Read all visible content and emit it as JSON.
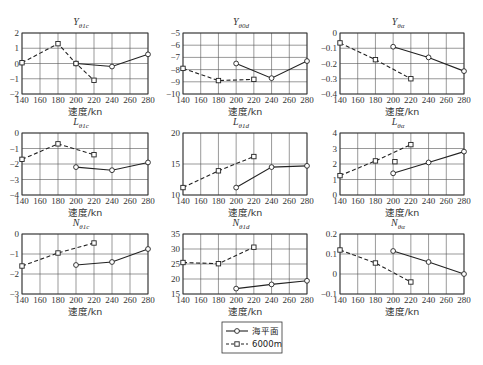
{
  "figure": {
    "layout": {
      "rows": 3,
      "cols": 3
    },
    "x_label": "速度/kn",
    "x_ticks": [
      140,
      160,
      180,
      200,
      220,
      240,
      260,
      280
    ],
    "legend": [
      {
        "label": "海平面",
        "style": "solid",
        "marker": "circle"
      },
      {
        "label": "6000m",
        "style": "dashed",
        "marker": "square"
      }
    ]
  },
  "chart_data": [
    {
      "type": "line",
      "title": "Y_θ1c",
      "title_main": "Y",
      "title_sub": "θ1c",
      "xlabel": "速度/kn",
      "ylabel": "",
      "xlim": [
        140,
        280
      ],
      "ylim": [
        -2,
        2
      ],
      "y_ticks": [
        -2,
        -1,
        0,
        1,
        2
      ],
      "grid": true,
      "series": [
        {
          "name": "海平面",
          "x": [
            200,
            240,
            280
          ],
          "values": [
            0.0,
            -0.2,
            0.6
          ]
        },
        {
          "name": "6000m",
          "x": [
            140,
            180,
            200,
            220
          ],
          "values": [
            0.05,
            1.3,
            0.0,
            -1.1
          ]
        }
      ]
    },
    {
      "type": "line",
      "title": "Y_θ0d",
      "title_main": "Y",
      "title_sub": "θ0d",
      "xlabel": "速度/kn",
      "ylabel": "",
      "xlim": [
        140,
        280
      ],
      "ylim": [
        -10,
        -5
      ],
      "y_ticks": [
        -10,
        -9,
        -8,
        -7,
        -6,
        -5
      ],
      "grid": true,
      "series": [
        {
          "name": "海平面",
          "x": [
            200,
            240,
            280
          ],
          "values": [
            -7.5,
            -8.7,
            -7.3
          ]
        },
        {
          "name": "6000m",
          "x": [
            140,
            180,
            220
          ],
          "values": [
            -7.9,
            -8.9,
            -8.8
          ]
        }
      ]
    },
    {
      "type": "line",
      "title": "Y_θα",
      "title_main": "Y",
      "title_sub": "θα",
      "xlabel": "速度/kn",
      "ylabel": "",
      "xlim": [
        140,
        280
      ],
      "ylim": [
        -0.4,
        0
      ],
      "y_ticks": [
        -0.4,
        -0.3,
        -0.2,
        -0.1,
        0
      ],
      "grid": true,
      "series": [
        {
          "name": "海平面",
          "x": [
            200,
            240,
            280
          ],
          "values": [
            -0.09,
            -0.16,
            -0.25
          ]
        },
        {
          "name": "6000m",
          "x": [
            140,
            180,
            220
          ],
          "values": [
            -0.065,
            -0.175,
            -0.3
          ]
        }
      ]
    },
    {
      "type": "line",
      "title": "L_θ1c",
      "title_main": "L",
      "title_sub": "θ1c",
      "xlabel": "速度/kn",
      "ylabel": "",
      "xlim": [
        140,
        280
      ],
      "ylim": [
        -4,
        0
      ],
      "y_ticks": [
        -4,
        -3,
        -2,
        -1,
        0
      ],
      "grid": true,
      "series": [
        {
          "name": "海平面",
          "x": [
            200,
            240,
            280
          ],
          "values": [
            -2.2,
            -2.4,
            -1.9
          ]
        },
        {
          "name": "6000m",
          "x": [
            140,
            180,
            220
          ],
          "values": [
            -1.7,
            -0.7,
            -1.4
          ]
        }
      ]
    },
    {
      "type": "line",
      "title": "L_θ1d",
      "title_main": "L",
      "title_sub": "θ1d",
      "xlabel": "速度/kn",
      "ylabel": "",
      "xlim": [
        140,
        280
      ],
      "ylim": [
        10,
        20
      ],
      "y_ticks": [
        10,
        15,
        20
      ],
      "grid": true,
      "series": [
        {
          "name": "海平面",
          "x": [
            200,
            240,
            280
          ],
          "values": [
            11.2,
            14.5,
            14.7
          ]
        },
        {
          "name": "6000m",
          "x": [
            140,
            180,
            220
          ],
          "values": [
            11.2,
            13.9,
            16.2
          ]
        }
      ]
    },
    {
      "type": "line",
      "title": "L_θα",
      "title_main": "L",
      "title_sub": "θα",
      "xlabel": "速度/kn",
      "ylabel": "",
      "xlim": [
        140,
        280
      ],
      "ylim": [
        0,
        4
      ],
      "y_ticks": [
        0,
        1,
        2,
        3,
        4
      ],
      "grid": true,
      "series": [
        {
          "name": "海平面",
          "x": [
            200,
            240,
            280
          ],
          "values": [
            1.4,
            2.1,
            2.8
          ]
        },
        {
          "name": "6000m",
          "x": [
            140,
            180,
            220
          ],
          "values": [
            1.25,
            2.2,
            3.25
          ]
        },
        {
          "name": "6000m (isolated)",
          "x": [
            202
          ],
          "values": [
            2.15
          ]
        }
      ]
    },
    {
      "type": "line",
      "title": "N_θ1c",
      "title_main": "N",
      "title_sub": "θ1c",
      "xlabel": "速度/kn",
      "ylabel": "",
      "xlim": [
        140,
        280
      ],
      "ylim": [
        -3,
        0
      ],
      "y_ticks": [
        -3,
        -2,
        -1,
        0
      ],
      "grid": true,
      "series": [
        {
          "name": "海平面",
          "x": [
            200,
            240,
            280
          ],
          "values": [
            -1.55,
            -1.4,
            -0.75
          ]
        },
        {
          "name": "6000m",
          "x": [
            140,
            180,
            220
          ],
          "values": [
            -1.6,
            -0.95,
            -0.45
          ]
        }
      ]
    },
    {
      "type": "line",
      "title": "N_θ1d",
      "title_main": "N",
      "title_sub": "θ1d",
      "xlabel": "速度/kn",
      "ylabel": "",
      "xlim": [
        140,
        280
      ],
      "ylim": [
        15,
        35
      ],
      "y_ticks": [
        15,
        20,
        25,
        30,
        35
      ],
      "grid": true,
      "series": [
        {
          "name": "海平面",
          "x": [
            200,
            240,
            280
          ],
          "values": [
            16.8,
            18.2,
            19.4
          ]
        },
        {
          "name": "6000m",
          "x": [
            140,
            180,
            220
          ],
          "values": [
            25.5,
            25.1,
            30.6
          ]
        }
      ]
    },
    {
      "type": "line",
      "title": "N_θα",
      "title_main": "N",
      "title_sub": "θα",
      "xlabel": "速度/kn",
      "ylabel": "",
      "xlim": [
        140,
        280
      ],
      "ylim": [
        -0.1,
        0.2
      ],
      "y_ticks": [
        -0.1,
        0,
        0.1,
        0.2
      ],
      "grid": true,
      "series": [
        {
          "name": "海平面",
          "x": [
            200,
            240,
            280
          ],
          "values": [
            0.115,
            0.06,
            0.0
          ]
        },
        {
          "name": "6000m",
          "x": [
            140,
            180,
            220
          ],
          "values": [
            0.12,
            0.055,
            -0.04
          ]
        }
      ]
    }
  ]
}
